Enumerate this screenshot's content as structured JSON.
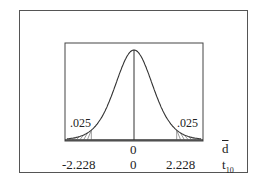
{
  "chart_data": {
    "type": "line",
    "title": "",
    "distribution": "t",
    "df": 10,
    "critical_values": [
      -2.228,
      2.228
    ],
    "tail_areas": [
      ".025",
      ".025"
    ],
    "center": "0",
    "axes": [
      {
        "variable": "d-bar",
        "label": "d̄",
        "ticks": [
          "0"
        ]
      },
      {
        "variable": "t10",
        "label": "t",
        "subscript": "10",
        "ticks": [
          "-2.228",
          "0",
          "2.228"
        ]
      }
    ],
    "grid": false,
    "legend": null
  },
  "labels": {
    "left_tail": ".025",
    "right_tail": ".025",
    "dbar_zero": "0",
    "dbar_symbol": "d",
    "t_left": "-2.228",
    "t_zero": "0",
    "t_right": "2.228",
    "t_symbol": "t",
    "t_sub": "10"
  }
}
